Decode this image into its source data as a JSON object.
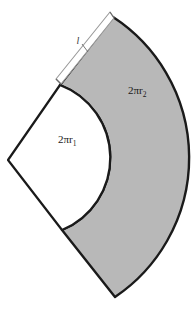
{
  "figure": {
    "name": "annulus-sector-diagram",
    "description_label": "lateral surface development of a frustum",
    "background_color": "#ffffff",
    "fill_color": "#b8b8b8",
    "outline_color": "#1a1a1a",
    "inner_region_color": "#ffffff",
    "labels": {
      "outer_arc": {
        "text": "2πr",
        "subscript": "2"
      },
      "inner_arc": {
        "text": "2πr",
        "subscript": "1"
      },
      "slant_side": {
        "text": "l"
      }
    },
    "geometry": {
      "apex": [
        8,
        160
      ],
      "inner_arc_start": [
        60,
        85
      ],
      "inner_arc_end": [
        62,
        230
      ],
      "inner_arc_bulge_x": 108,
      "outer_arc_start": [
        113,
        17
      ],
      "outer_arc_end": [
        115,
        297
      ],
      "outer_arc_bulge_x": 176
    }
  }
}
